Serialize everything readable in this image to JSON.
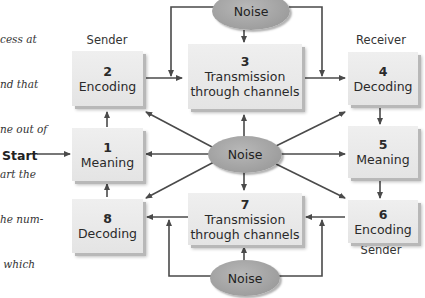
{
  "caption": {
    "lines": [
      "cess at",
      "nd that",
      "ne out of",
      "art the",
      "he num-",
      " which"
    ]
  },
  "start_label": "Start",
  "roles": {
    "sender_top": "Sender",
    "receiver_top": "Receiver",
    "receiver_bottom": "Receiver",
    "sender_bottom": "Sender"
  },
  "boxes": [
    {
      "id": 1,
      "num": "1",
      "label": "Meaning"
    },
    {
      "id": 2,
      "num": "2",
      "label": "Encoding"
    },
    {
      "id": 3,
      "num": "3",
      "label_line1": "Transmission",
      "label_line2": "through channels"
    },
    {
      "id": 4,
      "num": "4",
      "label": "Decoding"
    },
    {
      "id": 5,
      "num": "5",
      "label": "Meaning"
    },
    {
      "id": 6,
      "num": "6",
      "label": "Encoding"
    },
    {
      "id": 7,
      "num": "7",
      "label_line1": "Transmission",
      "label_line2": "through channels"
    },
    {
      "id": 8,
      "num": "8",
      "label": "Decoding"
    }
  ],
  "noise": {
    "top": "Noise",
    "center": "Noise",
    "bottom": "Noise"
  },
  "colors": {
    "box_fill": "#e8e8e8",
    "box_shadow": "#b8b8b8",
    "noise_fill": "#a6a6a6",
    "arrow": "#4a4a4a"
  }
}
